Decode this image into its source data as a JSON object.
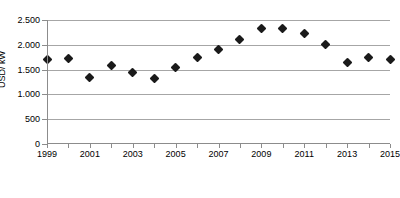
{
  "chart_data": {
    "type": "scatter",
    "title": "",
    "xlabel": "",
    "ylabel": "USD/ kW",
    "x": [
      1999,
      2000,
      2001,
      2002,
      2003,
      2004,
      2005,
      2006,
      2007,
      2008,
      2009,
      2010,
      2011,
      2012,
      2013,
      2014,
      2015
    ],
    "values": [
      1700,
      1720,
      1350,
      1580,
      1440,
      1320,
      1550,
      1740,
      1910,
      2110,
      2330,
      2330,
      2230,
      2010,
      1640,
      1750,
      1700
    ],
    "series": [
      {
        "name": "USD/ kW",
        "values": [
          1700,
          1720,
          1350,
          1580,
          1440,
          1320,
          1550,
          1740,
          1910,
          2110,
          2330,
          2330,
          2230,
          2010,
          1640,
          1750,
          1700
        ]
      }
    ],
    "xlim": [
      1999,
      2015
    ],
    "ylim": [
      0,
      2500
    ],
    "y_ticks": [
      0,
      500,
      1000,
      1500,
      2000,
      2500
    ],
    "y_tick_labels": [
      "0",
      "500",
      "1.000",
      "1.500",
      "2.000",
      "2.500"
    ],
    "x_ticks": [
      1999,
      2000,
      2001,
      2002,
      2003,
      2004,
      2005,
      2006,
      2007,
      2008,
      2009,
      2010,
      2011,
      2012,
      2013,
      2014,
      2015
    ],
    "x_tick_labels": [
      "1999",
      "",
      "2001",
      "",
      "2003",
      "",
      "2005",
      "",
      "2007",
      "",
      "2009",
      "",
      "2011",
      "",
      "2013",
      "",
      "2015"
    ],
    "grid": true,
    "legend": "none",
    "marker": "diamond",
    "marker_color": "#1a1a1a",
    "gridline_color": "#a6a6a6",
    "background_color": "#ffffff"
  }
}
